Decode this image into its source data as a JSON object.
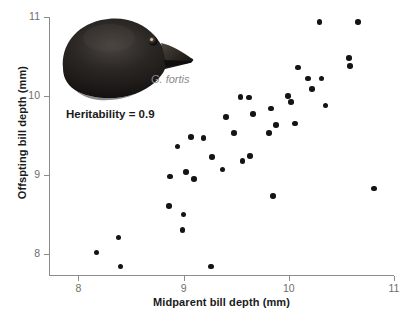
{
  "figure": {
    "species_label": "G. fortis",
    "annotation": "Heritability = 0.9",
    "photo_alt": "finch-head-photo"
  },
  "chart_data": {
    "type": "scatter",
    "title": "",
    "xlabel": "Midparent bill depth (mm)",
    "ylabel": "Offspting bill depth (mm)",
    "xlim": [
      7.72,
      11.0
    ],
    "ylim": [
      7.72,
      11.0
    ],
    "xticks": [
      8,
      9,
      10,
      11
    ],
    "yticks": [
      8,
      9,
      10,
      11
    ],
    "xtick_labels": [
      "8",
      "9",
      "10",
      "11"
    ],
    "ytick_labels": [
      "8",
      "9",
      "10",
      "11"
    ],
    "grid": false,
    "legend": "none",
    "marker_color": "#141414",
    "axis_color": "#8c8c8c",
    "label_color": "#1a1a1a",
    "tick_label_color": "#6e6e6e",
    "annotation_color": "#1a1a1a",
    "species_color": "#8a8a8a",
    "points": [
      {
        "x": 8.17,
        "y": 8.02
      },
      {
        "x": 8.38,
        "y": 8.21
      },
      {
        "x": 8.4,
        "y": 7.84
      },
      {
        "x": 8.86,
        "y": 8.61
      },
      {
        "x": 8.87,
        "y": 8.98
      },
      {
        "x": 8.94,
        "y": 9.36
      },
      {
        "x": 8.99,
        "y": 8.3
      },
      {
        "x": 9.0,
        "y": 8.5
      },
      {
        "x": 9.02,
        "y": 9.04
      },
      {
        "x": 9.07,
        "y": 9.48
      },
      {
        "x": 9.1,
        "y": 8.95
      },
      {
        "x": 9.19,
        "y": 9.47
      },
      {
        "x": 9.26,
        "y": 7.84
      },
      {
        "x": 9.27,
        "y": 9.23
      },
      {
        "x": 9.37,
        "y": 9.07
      },
      {
        "x": 9.4,
        "y": 9.73
      },
      {
        "x": 9.48,
        "y": 9.53
      },
      {
        "x": 9.54,
        "y": 9.99
      },
      {
        "x": 9.56,
        "y": 9.18
      },
      {
        "x": 9.62,
        "y": 9.98
      },
      {
        "x": 9.63,
        "y": 9.24
      },
      {
        "x": 9.66,
        "y": 9.77
      },
      {
        "x": 9.81,
        "y": 9.53
      },
      {
        "x": 9.83,
        "y": 9.84
      },
      {
        "x": 9.85,
        "y": 8.73
      },
      {
        "x": 9.88,
        "y": 9.63
      },
      {
        "x": 9.99,
        "y": 10.0
      },
      {
        "x": 10.02,
        "y": 9.92
      },
      {
        "x": 10.06,
        "y": 9.65
      },
      {
        "x": 10.09,
        "y": 10.36
      },
      {
        "x": 10.18,
        "y": 10.22
      },
      {
        "x": 10.22,
        "y": 10.09
      },
      {
        "x": 10.29,
        "y": 10.94
      },
      {
        "x": 10.31,
        "y": 10.22
      },
      {
        "x": 10.35,
        "y": 9.88
      },
      {
        "x": 10.57,
        "y": 10.48
      },
      {
        "x": 10.58,
        "y": 10.38
      },
      {
        "x": 10.66,
        "y": 10.94
      },
      {
        "x": 10.81,
        "y": 8.83
      }
    ]
  }
}
